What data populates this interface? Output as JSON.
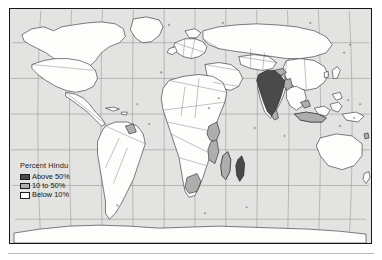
{
  "figure": {
    "kind": "choropleth-world-map",
    "projection": "robinson"
  },
  "legend": {
    "title": "Percent Hindu",
    "items": [
      {
        "label": "Above 50%",
        "color": "#4a4a4c",
        "category": "above-50"
      },
      {
        "label": "10 to 50%",
        "color": "#aeaeac",
        "category": "10-to-50"
      },
      {
        "label": "Below 10%",
        "color": "#fdfdfc",
        "category": "below-10"
      }
    ]
  },
  "map": {
    "ocean_color": "#e3e3e1",
    "land_color": "#fdfdfc",
    "border_color": "#15161a",
    "graticule_color": "#9a9a98",
    "highlight_dark": "#4a4a4c",
    "highlight_mid": "#aeaeac",
    "regions_above_50": [
      "India",
      "Nepal",
      "Mauritius"
    ],
    "regions_10_to_50": [
      "Bangladesh",
      "Bhutan",
      "Sri Lanka",
      "Guyana",
      "Suriname",
      "Fiji",
      "Madagascar",
      "Mozambique",
      "Kenya",
      "Tanzania",
      "South Africa",
      "Malaysia",
      "Indonesia"
    ]
  }
}
